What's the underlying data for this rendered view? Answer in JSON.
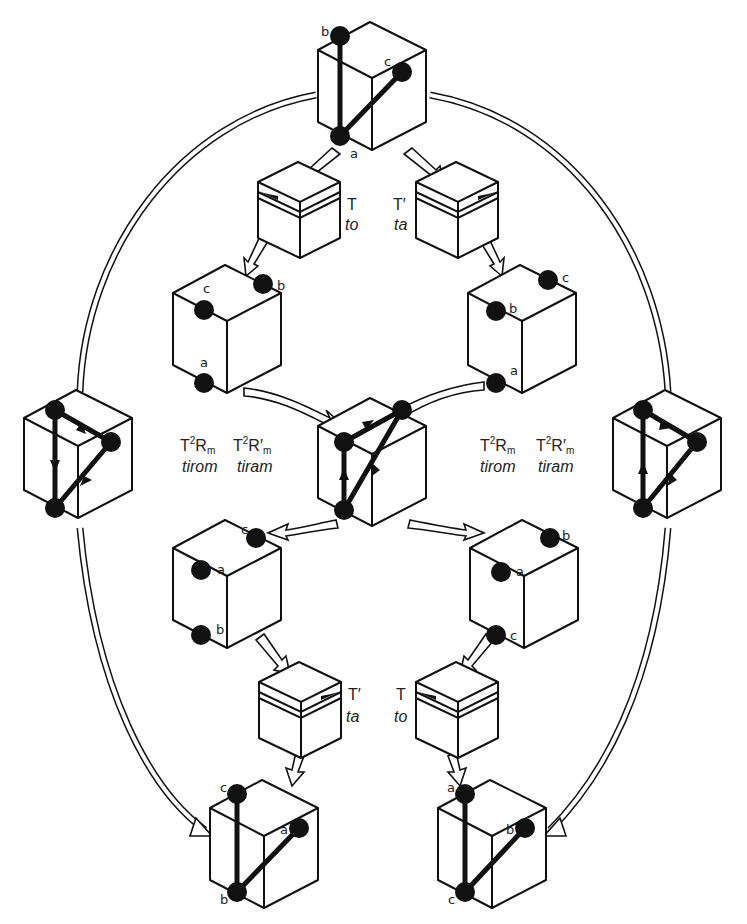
{
  "figure": {
    "atom_labels": {
      "top": {
        "a": "a",
        "b": "b",
        "c": "c"
      },
      "mid_left": {
        "a": "a",
        "b": "b",
        "c": "c"
      },
      "mid_right": {
        "a": "a",
        "b": "b",
        "c": "c"
      },
      "lower_left": {
        "a": "a",
        "b": "b",
        "c": "c"
      },
      "lower_right": {
        "a": "a",
        "b": "b",
        "c": "c"
      },
      "bottom_left": {
        "a": "a",
        "b": "b",
        "c": "c"
      },
      "bottom_right": {
        "a": "a",
        "b": "b",
        "c": "c"
      }
    },
    "operations": {
      "upper_left": {
        "symbol": "T",
        "name": "to"
      },
      "upper_right": {
        "symbol": "T′",
        "name": "ta"
      },
      "lower_left": {
        "symbol": "T′",
        "name": "ta"
      },
      "lower_right": {
        "symbol": "T",
        "name": "to"
      }
    },
    "transforms": {
      "left": {
        "op1_T": "T",
        "op1_exp": "2",
        "op1_R": "R",
        "op1_sub": "m",
        "op1_name": "tirom",
        "op2_T": "T",
        "op2_exp": "2",
        "op2_R": "R′",
        "op2_sub": "m",
        "op2_name": "tiram"
      },
      "right": {
        "op1_T": "T",
        "op1_exp": "2",
        "op1_R": "R",
        "op1_sub": "m",
        "op1_name": "tirom",
        "op2_T": "T",
        "op2_exp": "2",
        "op2_R": "R′",
        "op2_sub": "m",
        "op2_name": "tiram"
      }
    }
  }
}
